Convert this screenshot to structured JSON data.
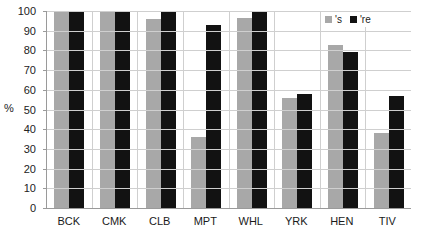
{
  "chart_data": {
    "type": "bar",
    "title": "",
    "xlabel": "",
    "ylabel": "%",
    "ylim": [
      0,
      100
    ],
    "ytick_step": 10,
    "yticks": [
      100,
      90,
      80,
      70,
      60,
      50,
      40,
      30,
      20,
      10,
      0
    ],
    "grid": true,
    "legend_position": "top-right",
    "categories": [
      "BCK",
      "CMK",
      "CLB",
      "MPT",
      "WHL",
      "YRK",
      "HEN",
      "TIV"
    ],
    "series": [
      {
        "name": "'s",
        "color": "#a8a8a8",
        "values": [
          100,
          100,
          96,
          36,
          96.5,
          56,
          83,
          38
        ]
      },
      {
        "name": "'re",
        "color": "#121212",
        "values": [
          100,
          100,
          100,
          93,
          100,
          58,
          79,
          57
        ]
      }
    ]
  },
  "legend": {
    "items": [
      {
        "label": "'s"
      },
      {
        "label": "'re"
      }
    ]
  },
  "colors": {
    "series_gray": "#a8a8a8",
    "series_black": "#121212",
    "gridline": "#cfcfcf",
    "axis": "#9a9a9a",
    "background": "#ffffff"
  }
}
